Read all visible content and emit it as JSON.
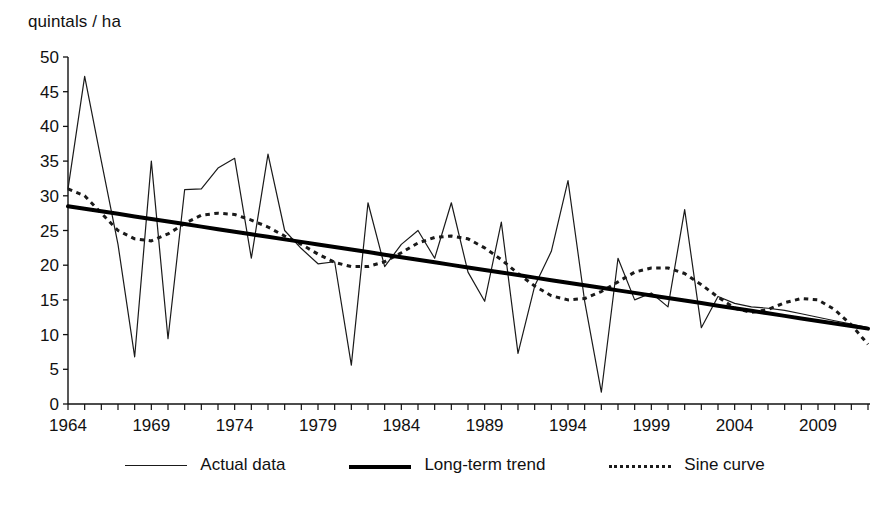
{
  "axis_title": "quintals / ha",
  "legend": {
    "items": [
      {
        "label": "Actual data",
        "style": "thin-solid"
      },
      {
        "label": "Long-term trend",
        "style": "thick-solid"
      },
      {
        "label": "Sine curve",
        "style": "dotted"
      }
    ]
  },
  "chart_data": {
    "type": "line",
    "title": "",
    "xlabel": "",
    "ylabel": "quintals / ha",
    "xlim": [
      1964,
      2012
    ],
    "ylim": [
      0,
      50
    ],
    "ytick_step": 5,
    "xtick_step": 1,
    "xtick_label_step": 5,
    "grid": false,
    "legend_position": "bottom-center",
    "yticks": [
      0,
      5,
      10,
      15,
      20,
      25,
      30,
      35,
      40,
      45,
      50
    ],
    "ytick_labels": [
      "0",
      "5",
      "10",
      "15",
      "20",
      "25",
      "30",
      "35",
      "40",
      "45",
      "50"
    ],
    "xtick_labels": [
      "1964",
      "1969",
      "1974",
      "1979",
      "1984",
      "1989",
      "1994",
      "1999",
      "2004",
      "2009"
    ],
    "xtick_label_years": [
      1964,
      1969,
      1974,
      1979,
      1984,
      1989,
      1994,
      1999,
      2004,
      2009
    ],
    "x": [
      1964,
      1965,
      1966,
      1967,
      1968,
      1969,
      1970,
      1971,
      1972,
      1973,
      1974,
      1975,
      1976,
      1977,
      1978,
      1979,
      1980,
      1981,
      1982,
      1983,
      1984,
      1985,
      1986,
      1987,
      1988,
      1989,
      1990,
      1991,
      1992,
      1993,
      1994,
      1995,
      1996,
      1997,
      1998,
      1999,
      2000,
      2001,
      2002,
      2003,
      2004,
      2005,
      2006,
      2007,
      2008,
      2009,
      2010,
      2011,
      2012
    ],
    "series": [
      {
        "name": "Actual data",
        "style": "thin-solid",
        "color": "#1a1a1a",
        "values": [
          31.0,
          47.2,
          35.0,
          23.0,
          6.8,
          35.0,
          9.4,
          30.9,
          31.0,
          34.0,
          35.4,
          21.0,
          36.0,
          25.0,
          22.4,
          20.2,
          20.5,
          5.6,
          29.0,
          19.8,
          23.0,
          25.0,
          21.0,
          29.0,
          19.0,
          14.8,
          26.2,
          7.3,
          17.0,
          22.0,
          32.2,
          14.8,
          1.7,
          21.0,
          15.0,
          16.0,
          14.0,
          28.0,
          11.0,
          15.5,
          14.5,
          14.0,
          13.8,
          13.5,
          13.0,
          12.5,
          12.0,
          11.5,
          11.0
        ]
      },
      {
        "name": "Long-term trend",
        "style": "thick-solid",
        "color": "#000000",
        "values": [
          28.5,
          28.13,
          27.77,
          27.4,
          27.03,
          26.66,
          26.3,
          25.93,
          25.56,
          25.19,
          24.83,
          24.46,
          24.09,
          23.72,
          23.36,
          22.99,
          22.62,
          22.25,
          21.89,
          21.52,
          21.15,
          20.78,
          20.42,
          20.05,
          19.68,
          19.31,
          18.95,
          18.58,
          18.21,
          17.84,
          17.48,
          17.11,
          16.74,
          16.37,
          16.01,
          15.64,
          15.27,
          14.9,
          14.54,
          14.17,
          13.8,
          13.43,
          13.07,
          12.7,
          12.33,
          11.96,
          11.6,
          11.23,
          10.86
        ]
      },
      {
        "name": "Sine curve",
        "style": "dotted",
        "color": "#1a1a1a",
        "values": [
          31.0,
          30.0,
          27.5,
          25.0,
          23.8,
          23.5,
          24.5,
          26.0,
          27.2,
          27.5,
          27.3,
          26.5,
          25.5,
          24.2,
          23.0,
          21.6,
          20.4,
          19.8,
          19.8,
          20.5,
          21.8,
          23.2,
          24.0,
          24.2,
          23.8,
          22.5,
          20.8,
          18.8,
          17.0,
          15.6,
          15.0,
          15.2,
          16.2,
          17.6,
          19.0,
          19.6,
          19.6,
          18.8,
          17.2,
          15.4,
          13.8,
          13.2,
          13.6,
          14.6,
          15.2,
          15.0,
          13.6,
          11.4,
          8.6
        ]
      }
    ]
  },
  "plot_geometry": {
    "left": 68,
    "right": 868,
    "top": 57,
    "bottom": 404
  }
}
